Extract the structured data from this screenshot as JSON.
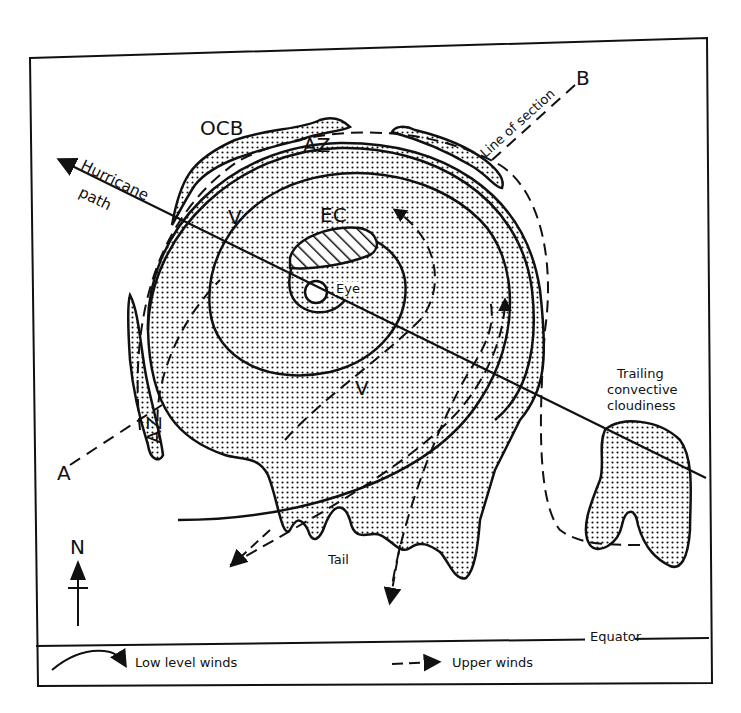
{
  "diagram": {
    "type": "hurricane-cloud-structure-schematic",
    "labels": {
      "ocb": "OCB",
      "az_top": "AZ",
      "az_left": "AZ",
      "v_upper": "V",
      "v_lower": "V",
      "ec": "EC",
      "eye": "Eye",
      "hurricane": "Hurricane",
      "path": "path",
      "line_of_section": "Line of section",
      "point_a": "A",
      "point_b": "B",
      "trailing_1": "Trailing",
      "trailing_2": "convective",
      "trailing_3": "cloudiness",
      "tail": "Tail",
      "north": "N",
      "equator": "Equator"
    },
    "legend": {
      "low_level": "Low level winds",
      "upper": "Upper winds"
    },
    "colors": {
      "ink": "#111111",
      "background": "#ffffff"
    }
  }
}
